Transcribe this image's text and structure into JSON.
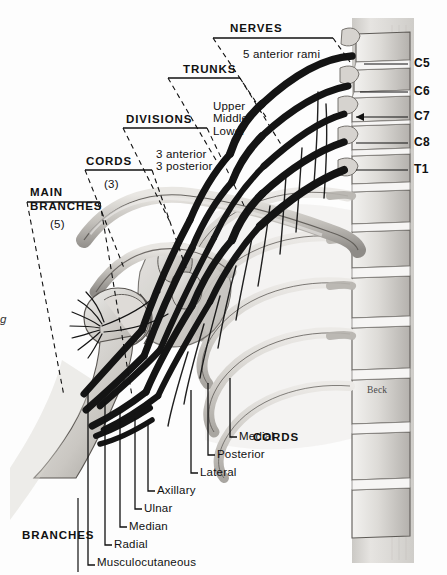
{
  "figure": {
    "signature": "Beck",
    "edge_fragment": "g"
  },
  "colors": {
    "ink": "#111111",
    "nerve": "#141414",
    "bone_light": "#e4e2de",
    "bone_mid": "#c8c6c2",
    "bone_dark": "#9a9793",
    "background": "#fdfdfd",
    "muscle": "#d9d6d1"
  },
  "brackets": [
    {
      "name": "nerves",
      "label": "NERVES",
      "sublabel": "5 anterior rami",
      "count": null,
      "label_x": 230,
      "label_y": 22,
      "sub_x": 243,
      "sub_y": 48
    },
    {
      "name": "trunks",
      "label": "TRUNKS",
      "sublabel": "Upper\nMiddle\nLower",
      "count": null,
      "label_x": 183,
      "label_y": 63,
      "sub_x": 213,
      "sub_y": 100
    },
    {
      "name": "divisions",
      "label": "DIVISIONS",
      "sublabel": "3 anterior\n3 posterior",
      "count": null,
      "label_x": 126,
      "label_y": 113,
      "sub_x": 156,
      "sub_y": 148
    },
    {
      "name": "cords",
      "label": "CORDS",
      "sublabel": "(3)",
      "count": "(3)",
      "label_x": 86,
      "label_y": 155,
      "sub_x": 104,
      "sub_y": 178
    },
    {
      "name": "main-branches",
      "label": "MAIN\nBRANCHES",
      "sublabel": "(5)",
      "count": "(5)",
      "label_x": 30,
      "label_y": 185,
      "sub_x": 50,
      "sub_y": 218
    }
  ],
  "vertebrae": [
    {
      "label": "C5",
      "y": 64,
      "line_x1": 364,
      "line_x2": 408,
      "text_x": 414
    },
    {
      "label": "C6",
      "y": 92,
      "line_x1": 360,
      "line_x2": 408,
      "text_x": 414
    },
    {
      "label": "C7",
      "y": 117,
      "line_x1": 356,
      "line_x2": 408,
      "text_x": 414
    },
    {
      "label": "C8",
      "y": 143,
      "line_x1": 356,
      "line_x2": 408,
      "text_x": 414
    },
    {
      "label": "T1",
      "y": 170,
      "line_x1": 356,
      "line_x2": 408,
      "text_x": 414
    }
  ],
  "branch_group": {
    "group_label": "BRANCHES",
    "group_label_x": 22,
    "group_label_y": 535,
    "items": [
      {
        "label": "Musculocutaneous",
        "line_x": 88,
        "line_y_top": 388,
        "hook_y": 565,
        "text_x": 96,
        "text_y": 558
      },
      {
        "label": "Radial",
        "line_x": 105,
        "line_y_top": 402,
        "hook_y": 545,
        "text_x": 113,
        "text_y": 538
      },
      {
        "label": "Median",
        "line_x": 120,
        "line_y_top": 412,
        "hook_y": 527,
        "text_x": 128,
        "text_y": 520
      },
      {
        "label": "Ulnar",
        "line_x": 135,
        "line_y_top": 418,
        "hook_y": 509,
        "text_x": 143,
        "text_y": 502
      },
      {
        "label": "Axillary",
        "line_x": 148,
        "line_y_top": 424,
        "hook_y": 491,
        "text_x": 156,
        "text_y": 484
      }
    ]
  },
  "cord_group": {
    "group_label": "CORDS",
    "group_label_x": 253,
    "group_label_y": 437,
    "items": [
      {
        "label": "Lateral",
        "line_x": 191,
        "line_y_top": 390,
        "hook_y": 473,
        "text_x": 199,
        "text_y": 466
      },
      {
        "label": "Posterior",
        "line_x": 208,
        "line_y_top": 383,
        "hook_y": 455,
        "text_x": 216,
        "text_y": 448
      },
      {
        "label": "Medial",
        "line_x": 230,
        "line_y_top": 378,
        "hook_y": 437,
        "text_x": 238,
        "text_y": 430
      }
    ]
  }
}
